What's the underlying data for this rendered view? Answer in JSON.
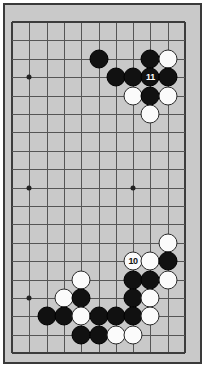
{
  "board": {
    "type": "go-board-diagram",
    "title": "Go board partial diagram",
    "colors": {
      "board_background": "#c9c9c9",
      "page_background": "#ffffff",
      "grid_line": "#555555",
      "border_line": "#3a3a3a",
      "black_stone": "#111111",
      "white_stone": "#fbfbfb",
      "black_label_text": "#ffffff"
    },
    "geometry": {
      "cols": 11,
      "rows": 19,
      "origin_x": 7,
      "origin_y": 17,
      "step_x": 17.3,
      "step_y": 18.4,
      "stone_diameter": 19,
      "hoshi_diameter": 5
    },
    "edges": {
      "left": true,
      "top": true,
      "right": true,
      "bottom": true
    },
    "hoshi": [
      {
        "col": 1,
        "row": 3
      },
      {
        "col": 1,
        "row": 9
      },
      {
        "col": 7,
        "row": 9
      },
      {
        "col": 1,
        "row": 15
      }
    ],
    "stones": [
      {
        "col": 5,
        "row": 2,
        "color": "black",
        "label": ""
      },
      {
        "col": 8,
        "row": 2,
        "color": "black",
        "label": ""
      },
      {
        "col": 9,
        "row": 2,
        "color": "white",
        "label": ""
      },
      {
        "col": 6,
        "row": 3,
        "color": "black",
        "label": ""
      },
      {
        "col": 7,
        "row": 3,
        "color": "black",
        "label": ""
      },
      {
        "col": 8,
        "row": 3,
        "color": "black",
        "label": "11"
      },
      {
        "col": 9,
        "row": 3,
        "color": "black",
        "label": ""
      },
      {
        "col": 7,
        "row": 4,
        "color": "white",
        "label": ""
      },
      {
        "col": 8,
        "row": 4,
        "color": "black",
        "label": ""
      },
      {
        "col": 9,
        "row": 4,
        "color": "white",
        "label": ""
      },
      {
        "col": 8,
        "row": 5,
        "color": "white",
        "label": ""
      },
      {
        "col": 9,
        "row": 12,
        "color": "white",
        "label": ""
      },
      {
        "col": 7,
        "row": 13,
        "color": "white",
        "label": "10"
      },
      {
        "col": 8,
        "row": 13,
        "color": "white",
        "label": ""
      },
      {
        "col": 9,
        "row": 13,
        "color": "black",
        "label": ""
      },
      {
        "col": 4,
        "row": 14,
        "color": "white",
        "label": ""
      },
      {
        "col": 7,
        "row": 14,
        "color": "black",
        "label": ""
      },
      {
        "col": 8,
        "row": 14,
        "color": "black",
        "label": ""
      },
      {
        "col": 9,
        "row": 14,
        "color": "white",
        "label": ""
      },
      {
        "col": 3,
        "row": 15,
        "color": "white",
        "label": ""
      },
      {
        "col": 4,
        "row": 15,
        "color": "black",
        "label": ""
      },
      {
        "col": 7,
        "row": 15,
        "color": "black",
        "label": ""
      },
      {
        "col": 8,
        "row": 15,
        "color": "white",
        "label": ""
      },
      {
        "col": 2,
        "row": 16,
        "color": "black",
        "label": ""
      },
      {
        "col": 3,
        "row": 16,
        "color": "black",
        "label": ""
      },
      {
        "col": 4,
        "row": 16,
        "color": "white",
        "label": ""
      },
      {
        "col": 5,
        "row": 16,
        "color": "black",
        "label": ""
      },
      {
        "col": 6,
        "row": 16,
        "color": "black",
        "label": ""
      },
      {
        "col": 7,
        "row": 16,
        "color": "black",
        "label": ""
      },
      {
        "col": 8,
        "row": 16,
        "color": "white",
        "label": ""
      },
      {
        "col": 4,
        "row": 17,
        "color": "black",
        "label": ""
      },
      {
        "col": 5,
        "row": 17,
        "color": "black",
        "label": ""
      },
      {
        "col": 6,
        "row": 17,
        "color": "white",
        "label": ""
      },
      {
        "col": 7,
        "row": 17,
        "color": "white",
        "label": ""
      }
    ],
    "move_labels": [
      {
        "number": "10",
        "color": "white"
      },
      {
        "number": "11",
        "color": "black"
      }
    ]
  }
}
